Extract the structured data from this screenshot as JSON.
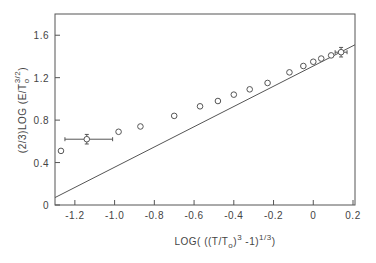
{
  "chart_data": {
    "type": "scatter",
    "title": "",
    "xlabel": "LOG( ((T/T_o)^3 -1)^(1/3) )",
    "ylabel": "(2/3)LOG (E/T_o^(3/2))",
    "xlim": [
      -1.3,
      0.21
    ],
    "ylim": [
      0,
      1.8
    ],
    "x_ticks": [
      -1.2,
      -1.0,
      -0.8,
      -0.6,
      -0.4,
      -0.2,
      0,
      0.2
    ],
    "x_tick_labels": [
      "-1.2",
      "-1.0",
      "-0.8",
      "-0.6",
      "-0.4",
      "-0.2",
      "0",
      "0.2"
    ],
    "y_ticks": [
      0,
      0.4,
      0.8,
      1.2,
      1.6
    ],
    "y_tick_labels": [
      "0",
      "0.4",
      "0.8",
      "1.2",
      "1.6"
    ],
    "grid": false,
    "legend": null,
    "series": [
      {
        "name": "data",
        "marker": "open-circle",
        "points": [
          {
            "x": -1.27,
            "y": 0.51
          },
          {
            "x": -1.14,
            "y": 0.62,
            "xerr": [
              0.11,
              0.13
            ],
            "yerr": 0.045
          },
          {
            "x": -0.98,
            "y": 0.69
          },
          {
            "x": -0.87,
            "y": 0.74
          },
          {
            "x": -0.7,
            "y": 0.84
          },
          {
            "x": -0.57,
            "y": 0.93
          },
          {
            "x": -0.48,
            "y": 0.98
          },
          {
            "x": -0.4,
            "y": 1.04
          },
          {
            "x": -0.32,
            "y": 1.09
          },
          {
            "x": -0.23,
            "y": 1.15
          },
          {
            "x": -0.12,
            "y": 1.25
          },
          {
            "x": -0.05,
            "y": 1.31
          },
          {
            "x": 0.0,
            "y": 1.35
          },
          {
            "x": 0.04,
            "y": 1.38
          },
          {
            "x": 0.09,
            "y": 1.41
          },
          {
            "x": 0.14,
            "y": 1.44,
            "xerr": [
              0.03,
              0.03
            ],
            "yerr": 0.045
          }
        ]
      },
      {
        "name": "fit line",
        "type": "line",
        "points": [
          {
            "x": -1.3,
            "y": 0.07
          },
          {
            "x": 0.21,
            "y": 1.51
          }
        ]
      }
    ]
  },
  "labels": {
    "xlabel_main": "LOG( ((T/T",
    "xlabel_sub": "o",
    "xlabel_close1": ")",
    "xlabel_sup1": "3",
    "xlabel_mid": " -1)",
    "xlabel_sup2": "1/3",
    "xlabel_end": ")",
    "ylabel_main": "(2/3)LOG (E/T",
    "ylabel_sub": "o",
    "ylabel_sup": "3/2",
    "ylabel_end": ")"
  }
}
